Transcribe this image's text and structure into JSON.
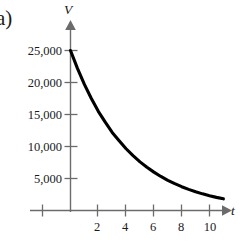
{
  "figure": {
    "part_label": "a)",
    "background": "#ffffff",
    "ink_color": "#1a1a1a",
    "axis_color": "#6b6b6b",
    "curve_color": "#000000"
  },
  "axes": {
    "y_axis_name": "V",
    "x_axis_name": "t",
    "x_tick_labels": [
      "2",
      "4",
      "6",
      "8",
      "10"
    ],
    "x_tick_values": [
      2,
      4,
      6,
      8,
      10
    ],
    "y_tick_labels": [
      "5,000",
      "10,000",
      "15,000",
      "20,000",
      "25,000"
    ],
    "y_tick_values": [
      5000,
      10000,
      15000,
      20000,
      25000
    ],
    "x_minor_negative_tick_value": -2,
    "x_arrow": true,
    "y_arrow": true
  },
  "chart_data": {
    "type": "line",
    "title": "",
    "subtitle": "",
    "xlabel": "t",
    "ylabel": "V",
    "xlim": [
      -2.5,
      12.5
    ],
    "ylim": [
      0,
      28000
    ],
    "grid": false,
    "legend": null,
    "annotations": [],
    "series": [
      {
        "name": "V(t)",
        "description": "exponential decay of value V over time t",
        "x": [
          0,
          0.5,
          1,
          1.5,
          2,
          2.5,
          3,
          3.5,
          4,
          4.5,
          5,
          5.5,
          6,
          6.5,
          7,
          7.5,
          8,
          8.5,
          9,
          9.5,
          10,
          10.5,
          11
        ],
        "values": [
          25000,
          22200,
          19700,
          17500,
          15500,
          13800,
          12200,
          10900,
          9650,
          8570,
          7600,
          6750,
          6000,
          5320,
          4720,
          4190,
          3720,
          3300,
          2930,
          2600,
          2310,
          2050,
          1820
        ]
      }
    ]
  }
}
